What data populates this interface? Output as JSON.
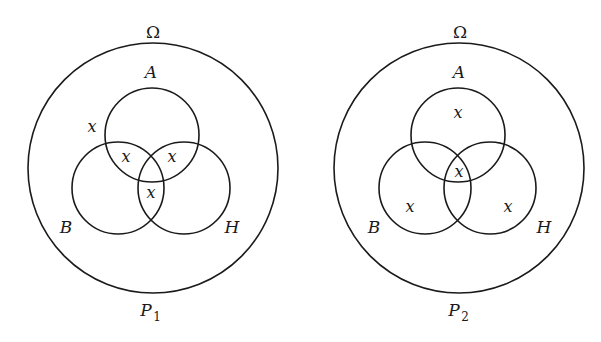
{
  "diagrams": [
    {
      "id": "left",
      "universe_label": "Ω",
      "caption": {
        "main": "P",
        "subscript": "1"
      },
      "sets": {
        "a": {
          "label": "A"
        },
        "b": {
          "label": "B"
        },
        "h": {
          "label": "H"
        }
      },
      "marks": [
        {
          "region": "outside-all (inside Ω, left of A)",
          "text": "x"
        },
        {
          "region": "A ∩ B only",
          "text": "x"
        },
        {
          "region": "A ∩ H only",
          "text": "x"
        },
        {
          "region": "B ∩ H only",
          "text": "x"
        }
      ]
    },
    {
      "id": "right",
      "universe_label": "Ω",
      "caption": {
        "main": "P",
        "subscript": "2"
      },
      "sets": {
        "a": {
          "label": "A"
        },
        "b": {
          "label": "B"
        },
        "h": {
          "label": "H"
        }
      },
      "marks": [
        {
          "region": "A only",
          "text": "x"
        },
        {
          "region": "A ∩ B ∩ H",
          "text": "x"
        },
        {
          "region": "B only",
          "text": "x"
        },
        {
          "region": "H only",
          "text": "x"
        }
      ]
    }
  ],
  "style": {
    "stroke_color": "#1a1a1a",
    "background": "#ffffff"
  }
}
